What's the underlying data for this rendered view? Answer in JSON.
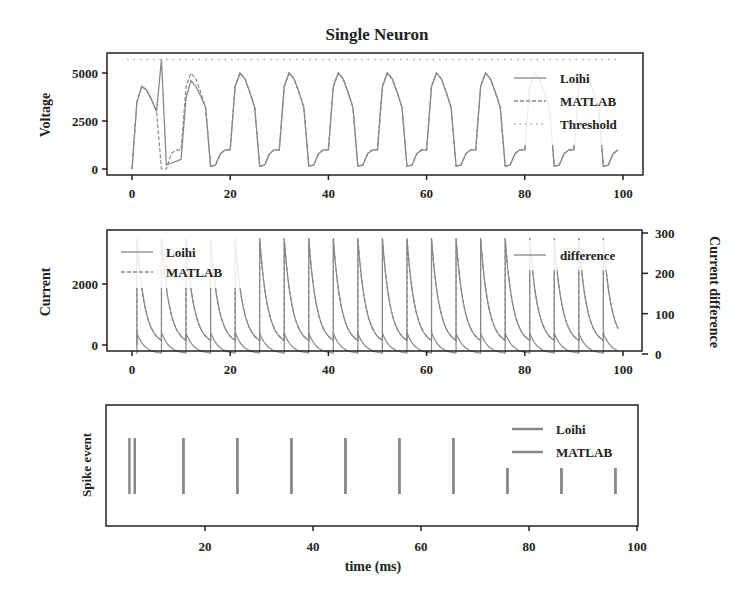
{
  "figure": {
    "title": "Single Neuron",
    "xlabel": "time (ms)"
  },
  "colors": {
    "line": "#888888",
    "axis": "#222222",
    "threshold": "#aaaaaa"
  },
  "chart_data": [
    {
      "type": "line",
      "title": "Single Neuron",
      "ylabel": "Voltage",
      "xlim": [
        -4,
        104
      ],
      "ylim": [
        -300,
        6000
      ],
      "xticks": [
        0,
        20,
        40,
        60,
        80,
        100
      ],
      "yticks": [
        0,
        2500,
        5000
      ],
      "legend": [
        "Loihi",
        "MATLAB",
        "Threshold"
      ],
      "legend_position": "upper right",
      "threshold": 5700,
      "series": [
        {
          "name": "Loihi",
          "style": "solid",
          "x": [
            0,
            1,
            2,
            3,
            4,
            5,
            6,
            7,
            8,
            9,
            10,
            11,
            12,
            13,
            14,
            15,
            16,
            17,
            18,
            19,
            20,
            21,
            22,
            23,
            24,
            25,
            26,
            27,
            28,
            29,
            30,
            31,
            32,
            33,
            34,
            35,
            36,
            37,
            38,
            39,
            40,
            41,
            42,
            43,
            44,
            45,
            46,
            47,
            48,
            49,
            50,
            51,
            52,
            53,
            54,
            55,
            56,
            57,
            58,
            59,
            60,
            61,
            62,
            63,
            64,
            65,
            66,
            67,
            68,
            69,
            70,
            71,
            72,
            73,
            74,
            75,
            76,
            77,
            78,
            79,
            80,
            81,
            82,
            83,
            84,
            85,
            86,
            87,
            88,
            89,
            90,
            91,
            92,
            93,
            94,
            95,
            96,
            97,
            98,
            99
          ],
          "values": [
            0,
            3500,
            4300,
            4100,
            3600,
            3000,
            5700,
            200,
            300,
            400,
            500,
            3700,
            4600,
            4300,
            3800,
            3200,
            150,
            200,
            800,
            1000,
            1000,
            4300,
            5000,
            4700,
            4000,
            3200,
            150,
            200,
            800,
            1000,
            1000,
            4300,
            5000,
            4700,
            4000,
            3200,
            150,
            200,
            800,
            1000,
            1000,
            4300,
            5000,
            4700,
            4000,
            3200,
            150,
            200,
            800,
            1000,
            1000,
            4300,
            5000,
            4700,
            4000,
            3200,
            150,
            200,
            800,
            1000,
            1000,
            4300,
            5000,
            4700,
            4000,
            3200,
            150,
            200,
            800,
            1000,
            1000,
            4300,
            5000,
            4700,
            4000,
            3200,
            150,
            200,
            800,
            1000,
            1000,
            4300,
            5000,
            4700,
            4000,
            3200,
            150,
            200,
            800,
            1000,
            1000,
            4300,
            5000,
            4700,
            4000,
            3200,
            150,
            200,
            800,
            1000
          ]
        },
        {
          "name": "MATLAB",
          "style": "dashed",
          "note": "overlaps Loihi except around t=5-13 where it resets at t=6 and peaks ~5000 at t=12"
        }
      ]
    },
    {
      "type": "line",
      "ylabel": "Current",
      "ylabel_right": "Current difference",
      "xlim": [
        -4,
        104
      ],
      "ylim": [
        -100,
        3700
      ],
      "ylim_right": [
        0,
        300
      ],
      "xticks": [
        0,
        20,
        40,
        60,
        80,
        100
      ],
      "yticks": [
        0,
        2000
      ],
      "yticks_right": [
        0,
        100,
        200,
        300
      ],
      "legend": [
        "Loihi",
        "MATLAB"
      ],
      "legend_right": [
        "difference"
      ],
      "spike_times": [
        1,
        6,
        11,
        16,
        21,
        26,
        31,
        36,
        41,
        46,
        51,
        56,
        61,
        66,
        71,
        76,
        81,
        86,
        91,
        96
      ],
      "series": [
        {
          "name": "Loihi",
          "peak_values": [
            3500,
            3500,
            3500,
            3500,
            3500,
            3500,
            3500,
            3500,
            3500,
            3500,
            3500,
            3500,
            3500,
            3500,
            3500,
            3500,
            3500,
            3500,
            3500,
            3500
          ],
          "decay_tau_ms": 1.5
        },
        {
          "name": "MATLAB",
          "peak_values": [
            3500,
            3500,
            3500,
            3500,
            3500,
            3500,
            3500,
            3500,
            3500,
            3500,
            3500,
            3500,
            3500,
            3500,
            3500,
            3500,
            3500,
            3500,
            3500,
            3500
          ]
        },
        {
          "name": "difference",
          "axis": "right",
          "peak_values": [
            52,
            54,
            52,
            54,
            54,
            52,
            52,
            52,
            52,
            52,
            52,
            54,
            54,
            52,
            52,
            52,
            52,
            52,
            52,
            52
          ]
        }
      ]
    },
    {
      "type": "scatter",
      "ylabel": "Spike event",
      "xlabel": "time (ms)",
      "xlim": [
        0,
        101
      ],
      "xticks": [
        20,
        40,
        60,
        80,
        100
      ],
      "legend": [
        "Loihi",
        "MATLAB"
      ],
      "series": [
        {
          "name": "Loihi",
          "spike_times": [
            6,
            16,
            26,
            36,
            46,
            56,
            66,
            76,
            86,
            96
          ]
        },
        {
          "name": "MATLAB",
          "spike_times": [
            7,
            16,
            26,
            36,
            46,
            56,
            66,
            76,
            86,
            96
          ]
        }
      ]
    }
  ]
}
